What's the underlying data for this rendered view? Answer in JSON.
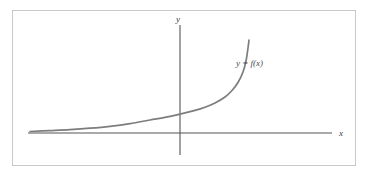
{
  "figure": {
    "border_color": "#c9c9c9",
    "background_color": "#ffffff",
    "axis_color": "#555555",
    "curve_color": "#7d7d7d",
    "label_color": "#3a3a3a"
  },
  "axes": {
    "x_axis_label": "x",
    "y_axis_label": "y",
    "origin_x": 180,
    "origin_y": 133,
    "x_axis_start": 28,
    "x_axis_end": 332,
    "y_axis_top": 25,
    "y_axis_bottom": 155
  },
  "annotations": {
    "curve_label": "y = f(x)",
    "curve_label_x": 236,
    "curve_label_y": 66
  },
  "chart_data": {
    "type": "line",
    "title": "",
    "subtitle": "",
    "xlabel": "x",
    "ylabel": "y",
    "grid": false,
    "legend_position": "inline-annotation",
    "legend_entries": [
      "y = f(x)"
    ],
    "annotations": [
      "y = f(x)"
    ],
    "axis_style": "arrowless-cartesian-axes-through-origin",
    "xlim": [
      -4.2,
      2.1
    ],
    "ylim": [
      -0.3,
      4.0
    ],
    "series": [
      {
        "name": "y = f(x)",
        "x": [
          -4.2,
          -3.9,
          -3.6,
          -3.3,
          -3.0,
          -2.7,
          -2.4,
          -2.1,
          -1.8,
          -1.5,
          -1.2,
          -0.9,
          -0.6,
          -0.3,
          0.0,
          0.3,
          0.6,
          0.9,
          1.2,
          1.5,
          1.8
        ],
        "y": [
          0.05,
          0.07,
          0.09,
          0.11,
          0.14,
          0.18,
          0.22,
          0.28,
          0.35,
          0.44,
          0.55,
          0.69,
          0.86,
          1.08,
          1.35,
          1.69,
          2.11,
          2.64,
          3.3,
          4.12,
          5.15
        ]
      }
    ],
    "curve_points": [
      [
        30,
        131.5
      ],
      [
        50,
        130.6
      ],
      [
        70,
        129.6
      ],
      [
        90,
        128.2
      ],
      [
        110,
        126.3
      ],
      [
        130,
        123.6
      ],
      [
        150,
        120.0
      ],
      [
        165,
        117.4
      ],
      [
        180,
        114.2
      ],
      [
        195,
        110.4
      ],
      [
        205,
        107.2
      ],
      [
        215,
        103.0
      ],
      [
        225,
        97.0
      ],
      [
        232,
        90.5
      ],
      [
        238,
        82.5
      ],
      [
        243,
        72.0
      ],
      [
        246,
        61.0
      ],
      [
        248,
        48.0
      ],
      [
        249,
        40.0
      ]
    ]
  }
}
